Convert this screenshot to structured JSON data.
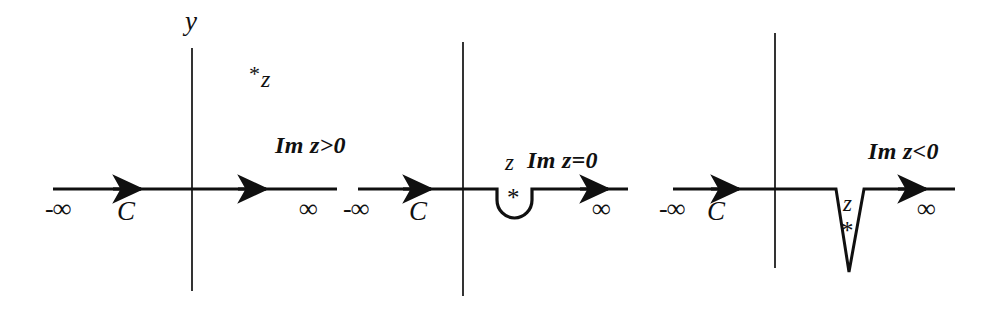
{
  "figure": {
    "background": "#ffffff",
    "ink": "#101010",
    "width": 994,
    "height": 315
  },
  "panels": [
    {
      "id": "panel-1",
      "condition": "Im z>0",
      "pole_label": "z",
      "pole_marker": "*",
      "pole_position": "above-axis",
      "contour_label": "C",
      "left_limit": "-∞",
      "right_limit": "∞",
      "vertical_axis_label": "y",
      "contour_shape": "straight",
      "axis_y": 189,
      "axis_x_start": 53,
      "axis_x_end": 337,
      "vaxis_x": 192,
      "vaxis_y_top": 48,
      "vaxis_y_bottom": 291,
      "arrows_x": [
        128,
        252
      ]
    },
    {
      "id": "panel-2",
      "condition": "Im z=0",
      "pole_label": "z",
      "pole_marker": "*",
      "pole_position": "on-axis",
      "contour_label": "C",
      "left_limit": "-∞",
      "right_limit": "∞",
      "vertical_axis_label": "",
      "contour_shape": "semicircular-indentation",
      "axis_y": 189,
      "axis_x_start": 358,
      "axis_x_end": 628,
      "vaxis_x": 463,
      "vaxis_y_top": 42,
      "vaxis_y_bottom": 296,
      "detour_x_left": 497,
      "detour_x_right": 532,
      "detour_depth": 30,
      "arrows_x": [
        418,
        594
      ]
    },
    {
      "id": "panel-3",
      "condition": "Im z<0",
      "pole_label": "z",
      "pole_marker": "*",
      "pole_position": "below-axis",
      "contour_label": "C",
      "left_limit": "-∞",
      "right_limit": "∞",
      "vertical_axis_label": "",
      "contour_shape": "deep-wedge-indentation",
      "axis_y": 189,
      "axis_x_start": 673,
      "axis_x_end": 955,
      "vaxis_x": 775,
      "vaxis_y_top": 33,
      "vaxis_y_bottom": 268,
      "detour_x_left": 836,
      "detour_x_right": 864,
      "detour_apex_x": 849,
      "detour_apex_y": 272,
      "arrows_x": [
        725,
        912
      ]
    }
  ],
  "labels": {
    "p1_y": "y",
    "p1_zstar_star": "*",
    "p1_zstar_z": "z",
    "p1_cond": "Im z>0",
    "p1_neginf": "-∞",
    "p1_c": "C",
    "p1_inf": "∞",
    "p2_neginf": "-∞",
    "p2_c": "C",
    "p2_z": "z",
    "p2_cond": "Im z=0",
    "p2_star": "*",
    "p2_inf": "∞",
    "p3_neginf": "-∞",
    "p3_c": "C",
    "p3_cond": "Im z<0",
    "p3_z": "z",
    "p3_star": "*",
    "p3_inf": "∞"
  }
}
